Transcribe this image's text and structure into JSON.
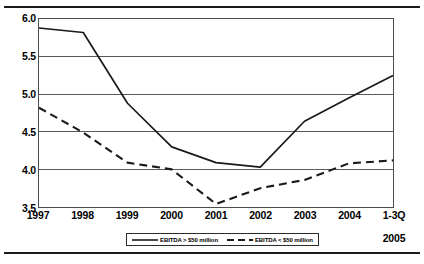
{
  "chart_data": {
    "type": "line",
    "title": "",
    "subtitle": "",
    "xlabel": "",
    "ylabel": "",
    "categories": [
      "1997",
      "1998",
      "1999",
      "2000",
      "2001",
      "2002",
      "2003",
      "2004",
      "1-3Q 2005"
    ],
    "category_labels": [
      {
        "line1": "1997",
        "line2": ""
      },
      {
        "line1": "1998",
        "line2": ""
      },
      {
        "line1": "1999",
        "line2": ""
      },
      {
        "line1": "2000",
        "line2": ""
      },
      {
        "line1": "2001",
        "line2": ""
      },
      {
        "line1": "2002",
        "line2": ""
      },
      {
        "line1": "2003",
        "line2": ""
      },
      {
        "line1": "2004",
        "line2": ""
      },
      {
        "line1": "1-3Q",
        "line2": "2005"
      }
    ],
    "ylim": [
      3.5,
      6.0
    ],
    "yticks": [
      3.5,
      4.0,
      4.5,
      5.0,
      5.5,
      6.0
    ],
    "ytick_labels": [
      "3.5",
      "4.0",
      "4.5",
      "5.0",
      "5.5",
      "6.0"
    ],
    "grid": true,
    "grid_axis": "y",
    "legend_position": "bottom",
    "series": [
      {
        "name": "EBITDA > $50 million",
        "style": "solid",
        "color": "#1a1a1a",
        "values": [
          5.88,
          5.82,
          4.88,
          4.3,
          4.09,
          4.03,
          4.64,
          4.95,
          5.25
        ]
      },
      {
        "name": "EBITDA < $50 million",
        "style": "dashed",
        "color": "#1a1a1a",
        "values": [
          4.82,
          4.49,
          4.09,
          4.0,
          3.54,
          3.75,
          3.86,
          4.08,
          4.12
        ]
      }
    ]
  },
  "legend": {
    "entries": [
      {
        "label": "EBITDA > $50 million"
      },
      {
        "label": "EBITDA < $50 million"
      }
    ]
  }
}
